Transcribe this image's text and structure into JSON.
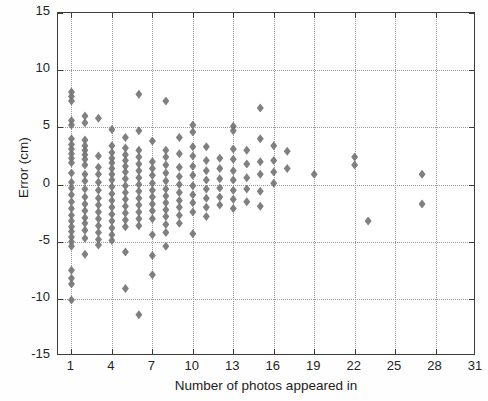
{
  "chart_data": {
    "type": "scatter",
    "title": "",
    "xlabel": "Number of photos appeared in",
    "ylabel": "Error (cm)",
    "xlim": [
      0,
      31
    ],
    "ylim": [
      -15,
      15
    ],
    "xticks": [
      1,
      4,
      7,
      10,
      13,
      16,
      19,
      22,
      25,
      28,
      31
    ],
    "xticklabels": [
      "1",
      "4",
      "7",
      "10",
      "13",
      "16",
      "19",
      "22",
      "25",
      "28",
      "31"
    ],
    "yticks": [
      15,
      10,
      5,
      0,
      -5,
      -10,
      -15
    ],
    "yticklabels": [
      "15",
      "10",
      "5",
      "0",
      "-5",
      "-10",
      "-15"
    ],
    "grid": true,
    "gridstyle": "dotted",
    "marker": "diamond",
    "marker_color": "#757575",
    "marker_size": 7,
    "legend": null,
    "series": [
      {
        "name": "error-per-photo-count",
        "points": [
          [
            1,
            8.1
          ],
          [
            1,
            7.7
          ],
          [
            1,
            7.3
          ],
          [
            1,
            5.6
          ],
          [
            1,
            5.2
          ],
          [
            1,
            4.0
          ],
          [
            1,
            3.5
          ],
          [
            1,
            3.1
          ],
          [
            1,
            2.7
          ],
          [
            1,
            2.3
          ],
          [
            1,
            1.9
          ],
          [
            1,
            1.0
          ],
          [
            1,
            0.2
          ],
          [
            1,
            -0.3
          ],
          [
            1,
            -0.9
          ],
          [
            1,
            -1.5
          ],
          [
            1,
            -2.1
          ],
          [
            1,
            -2.7
          ],
          [
            1,
            -3.2
          ],
          [
            1,
            -3.7
          ],
          [
            1,
            -4.1
          ],
          [
            1,
            -4.6
          ],
          [
            1,
            -5.0
          ],
          [
            1,
            -5.4
          ],
          [
            1,
            -7.5
          ],
          [
            1,
            -8.2
          ],
          [
            1,
            -8.7
          ],
          [
            1,
            -10.1
          ],
          [
            2,
            6.0
          ],
          [
            2,
            5.4
          ],
          [
            2,
            3.9
          ],
          [
            2,
            3.4
          ],
          [
            2,
            3.0
          ],
          [
            2,
            2.6
          ],
          [
            2,
            2.2
          ],
          [
            2,
            1.7
          ],
          [
            2,
            0.9
          ],
          [
            2,
            0.3
          ],
          [
            2,
            -0.4
          ],
          [
            2,
            -1.1
          ],
          [
            2,
            -1.7
          ],
          [
            2,
            -2.3
          ],
          [
            2,
            -2.9
          ],
          [
            2,
            -3.4
          ],
          [
            2,
            -4.0
          ],
          [
            2,
            -4.7
          ],
          [
            2,
            -6.1
          ],
          [
            3,
            5.8
          ],
          [
            3,
            2.5
          ],
          [
            3,
            1.5
          ],
          [
            3,
            0.9
          ],
          [
            3,
            0.2
          ],
          [
            3,
            -0.5
          ],
          [
            3,
            -1.2
          ],
          [
            3,
            -1.8
          ],
          [
            3,
            -2.4
          ],
          [
            3,
            -3.0
          ],
          [
            3,
            -3.6
          ],
          [
            3,
            -4.2
          ],
          [
            3,
            -4.8
          ],
          [
            3,
            -5.3
          ],
          [
            4,
            4.8
          ],
          [
            4,
            3.4
          ],
          [
            4,
            2.8
          ],
          [
            4,
            2.3
          ],
          [
            4,
            1.9
          ],
          [
            4,
            1.4
          ],
          [
            4,
            0.9
          ],
          [
            4,
            0.4
          ],
          [
            4,
            -0.2
          ],
          [
            4,
            -0.8
          ],
          [
            4,
            -1.4
          ],
          [
            4,
            -2.0
          ],
          [
            4,
            -2.6
          ],
          [
            4,
            -3.2
          ],
          [
            4,
            -3.8
          ],
          [
            4,
            -4.4
          ],
          [
            4,
            -4.9
          ],
          [
            5,
            4.1
          ],
          [
            5,
            3.2
          ],
          [
            5,
            2.6
          ],
          [
            5,
            2.1
          ],
          [
            5,
            1.6
          ],
          [
            5,
            1.1
          ],
          [
            5,
            0.5
          ],
          [
            5,
            -0.1
          ],
          [
            5,
            -0.7
          ],
          [
            5,
            -1.3
          ],
          [
            5,
            -1.9
          ],
          [
            5,
            -2.5
          ],
          [
            5,
            -3.1
          ],
          [
            5,
            -3.7
          ],
          [
            5,
            -5.9
          ],
          [
            5,
            -9.1
          ],
          [
            6,
            7.9
          ],
          [
            6,
            4.7
          ],
          [
            6,
            3.0
          ],
          [
            6,
            2.4
          ],
          [
            6,
            1.8
          ],
          [
            6,
            1.2
          ],
          [
            6,
            0.6
          ],
          [
            6,
            0.0
          ],
          [
            6,
            -0.6
          ],
          [
            6,
            -1.2
          ],
          [
            6,
            -1.8
          ],
          [
            6,
            -2.4
          ],
          [
            6,
            -3.0
          ],
          [
            6,
            -3.6
          ],
          [
            6,
            -11.4
          ],
          [
            7,
            3.8
          ],
          [
            7,
            2.0
          ],
          [
            7,
            1.4
          ],
          [
            7,
            0.8
          ],
          [
            7,
            0.1
          ],
          [
            7,
            -0.5
          ],
          [
            7,
            -1.1
          ],
          [
            7,
            -1.7
          ],
          [
            7,
            -2.3
          ],
          [
            7,
            -3.0
          ],
          [
            7,
            -4.4
          ],
          [
            7,
            -6.2
          ],
          [
            7,
            -7.9
          ],
          [
            8,
            7.3
          ],
          [
            8,
            3.0
          ],
          [
            8,
            2.4
          ],
          [
            8,
            1.7
          ],
          [
            8,
            1.0
          ],
          [
            8,
            0.3
          ],
          [
            8,
            -0.4
          ],
          [
            8,
            -1.0
          ],
          [
            8,
            -1.6
          ],
          [
            8,
            -2.2
          ],
          [
            8,
            -2.8
          ],
          [
            8,
            -3.5
          ],
          [
            8,
            -4.2
          ],
          [
            8,
            -5.4
          ],
          [
            9,
            4.1
          ],
          [
            9,
            2.7
          ],
          [
            9,
            1.5
          ],
          [
            9,
            0.7
          ],
          [
            9,
            0.0
          ],
          [
            9,
            -0.7
          ],
          [
            9,
            -1.4
          ],
          [
            9,
            -2.0
          ],
          [
            9,
            -2.7
          ],
          [
            9,
            -3.4
          ],
          [
            10,
            5.2
          ],
          [
            10,
            4.6
          ],
          [
            10,
            3.3
          ],
          [
            10,
            2.5
          ],
          [
            10,
            1.6
          ],
          [
            10,
            0.8
          ],
          [
            10,
            -0.1
          ],
          [
            10,
            -0.9
          ],
          [
            10,
            -1.6
          ],
          [
            10,
            -2.4
          ],
          [
            10,
            -4.3
          ],
          [
            11,
            3.3
          ],
          [
            11,
            2.1
          ],
          [
            11,
            1.2
          ],
          [
            11,
            0.4
          ],
          [
            11,
            -0.4
          ],
          [
            11,
            -1.2
          ],
          [
            11,
            -2.0
          ],
          [
            11,
            -2.8
          ],
          [
            12,
            2.3
          ],
          [
            12,
            1.4
          ],
          [
            12,
            0.5
          ],
          [
            12,
            -0.3
          ],
          [
            12,
            -1.1
          ],
          [
            12,
            -1.8
          ],
          [
            13,
            5.1
          ],
          [
            13,
            4.7
          ],
          [
            13,
            3.1
          ],
          [
            13,
            2.2
          ],
          [
            13,
            1.2
          ],
          [
            13,
            0.4
          ],
          [
            13,
            -0.5
          ],
          [
            13,
            -1.3
          ],
          [
            13,
            -2.1
          ],
          [
            14,
            3.0
          ],
          [
            14,
            1.8
          ],
          [
            14,
            0.6
          ],
          [
            14,
            -0.4
          ],
          [
            14,
            -1.5
          ],
          [
            15,
            6.7
          ],
          [
            15,
            4.0
          ],
          [
            15,
            2.0
          ],
          [
            15,
            0.9
          ],
          [
            15,
            -0.6
          ],
          [
            15,
            -1.9
          ],
          [
            16,
            3.4
          ],
          [
            16,
            2.1
          ],
          [
            16,
            1.1
          ],
          [
            16,
            0.1
          ],
          [
            17,
            2.9
          ],
          [
            17,
            1.4
          ],
          [
            19,
            0.9
          ],
          [
            22,
            2.4
          ],
          [
            22,
            1.7
          ],
          [
            23,
            -3.2
          ],
          [
            27,
            0.9
          ],
          [
            27,
            -1.7
          ]
        ]
      }
    ]
  }
}
